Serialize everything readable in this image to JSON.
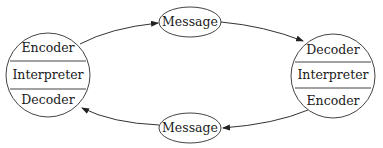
{
  "diagram": {
    "type": "communication-cycle",
    "nodes": {
      "left_party": {
        "sections": [
          "Encoder",
          "Interpreter",
          "Decoder"
        ]
      },
      "right_party": {
        "sections": [
          "Decoder",
          "Interpreter",
          "Encoder"
        ]
      },
      "top_message": {
        "label": "Message"
      },
      "bottom_message": {
        "label": "Message"
      }
    },
    "edges": [
      {
        "from": "left_party.Encoder",
        "to": "top_message"
      },
      {
        "from": "top_message",
        "to": "right_party.Decoder"
      },
      {
        "from": "right_party.Encoder",
        "to": "bottom_message"
      },
      {
        "from": "bottom_message",
        "to": "left_party.Decoder"
      }
    ],
    "colors": {
      "stroke": "#444444",
      "text": "#1a1a1a",
      "background": "#ffffff"
    }
  }
}
